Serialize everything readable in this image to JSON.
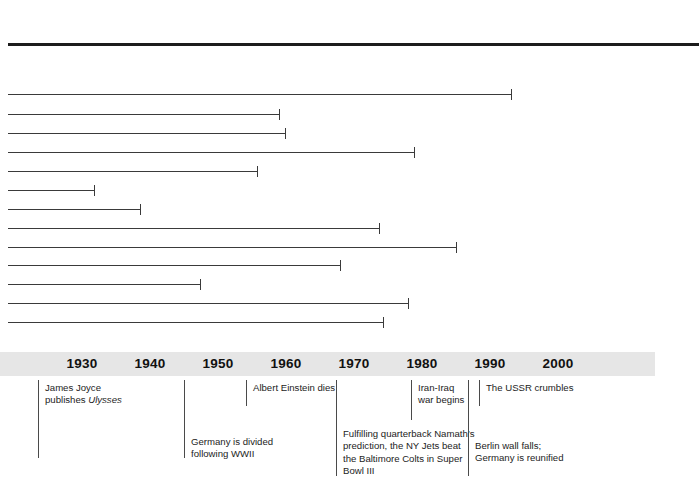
{
  "chart_data": {
    "type": "bar",
    "orientation": "horizontal",
    "title": "",
    "xlabel": "",
    "ylabel": "",
    "xlim": [
      1919,
      2006
    ],
    "grid": false,
    "legend": null,
    "axis": {
      "tick_labels": [
        "1930",
        "1940",
        "1950",
        "1960",
        "1970",
        "1980",
        "1990",
        "2000"
      ],
      "tick_values": [
        1930,
        1940,
        1950,
        1960,
        1970,
        1980,
        1990,
        2000
      ],
      "band_color": "#e6e6e6"
    },
    "bar_start_year": 1919,
    "bars": [
      {
        "start": 1919,
        "end": 1982
      },
      {
        "start": 1919,
        "end": 1948
      },
      {
        "start": 1919,
        "end": 1950
      },
      {
        "start": 1919,
        "end": 1978
      },
      {
        "start": 1919,
        "end": 1956
      },
      {
        "start": 1919,
        "end": 1941
      },
      {
        "start": 1919,
        "end": 1932
      },
      {
        "start": 1919,
        "end": 1938
      },
      {
        "start": 1919,
        "end": 1974
      },
      {
        "start": 1919,
        "end": 1985
      },
      {
        "start": 1919,
        "end": 1967
      },
      {
        "start": 1919,
        "end": 1947
      },
      {
        "start": 1919,
        "end": 1978
      },
      {
        "start": 1919,
        "end": 1974
      }
    ],
    "annotations": [
      {
        "year": 1922,
        "text": "James Joyce\npublishes Ulysses",
        "italic_part": "Ulysses"
      },
      {
        "year": 1945,
        "text": "Germany is divided\nfollowing WWII"
      },
      {
        "year": 1955,
        "text": "Albert Einstein dies"
      },
      {
        "year": 1969,
        "text": "Fulfilling quarterback Namath’s\nprediction, the NY Jets beat\nthe Baltimore Colts in Super\nBowl III"
      },
      {
        "year": 1980,
        "text": "Iran-Iraq\nwar begins"
      },
      {
        "year": 1989,
        "text": "Berlin wall falls;\nGermany is reunified"
      },
      {
        "year": 1991,
        "text": "The USSR crumbles"
      }
    ]
  },
  "layout": {
    "bar_left_px": 8,
    "year_origin_px": 82,
    "px_per_year": 0.68,
    "bar_rows_y": [
      46,
      94,
      114,
      133,
      152,
      171,
      190,
      209,
      228,
      247,
      265,
      284,
      303,
      322
    ],
    "top_rule_y": 43,
    "axis_band_y": 352,
    "axis_band_height": 24,
    "axis_band_width": 655,
    "annotations_top": 376
  },
  "colors": {
    "background": "#ffffff",
    "rule": "#1c1c1c",
    "bar": "#3a3a3a",
    "band": "#e6e6e6",
    "text": "#232323"
  },
  "bar_end_px": [
    512,
    280,
    286,
    415,
    258,
    95,
    141,
    380,
    457,
    341,
    201,
    409,
    384
  ],
  "annotation_px": [
    38,
    184,
    246,
    336,
    411,
    468,
    479
  ],
  "annotation_layout": [
    {
      "top": 4,
      "height": 78,
      "text_top": 0
    },
    {
      "top": 4,
      "height": 78,
      "text_top": 54
    },
    {
      "top": 4,
      "height": 26,
      "text_top": 0
    },
    {
      "top": 4,
      "height": 96,
      "text_top": 46
    },
    {
      "top": 4,
      "height": 40,
      "text_top": 0
    },
    {
      "top": 4,
      "height": 96,
      "text_top": 58
    },
    {
      "top": 4,
      "height": 26,
      "text_top": 0
    }
  ]
}
